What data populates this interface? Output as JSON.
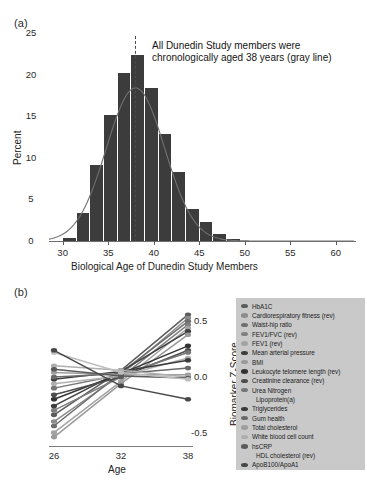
{
  "figure": {
    "panel_a_tag": "(a)",
    "panel_b_tag": "(b)"
  },
  "panel_a": {
    "annotation_line1": "All Dunedin Study members were",
    "annotation_line2": "chronologically aged 38 years (gray line)",
    "annotation": "All Dunedin Study members were\nchronologically aged 38 years (gray line)",
    "ylabel": "Percent",
    "xlabel": "Biological Age of Dunedin Study Members",
    "xticks": [
      "30",
      "35",
      "40",
      "45",
      "50",
      "55",
      "60"
    ],
    "yticks": [
      "0",
      "5",
      "10",
      "15",
      "20",
      "25"
    ],
    "reference_line_age": "38",
    "bar_color": "#3c3c3c",
    "curve_color": "#707070",
    "dash_color": "#4a4a4a"
  },
  "panel_b": {
    "ylabel": "Biomarker Z-Score",
    "xlabel": "Age",
    "xticks": [
      "26",
      "32",
      "38"
    ],
    "yticks": [
      "0.5",
      "0.0",
      "-0.5"
    ],
    "legend_background": "#c9c9c9",
    "legend_title": "",
    "legend": [
      {
        "label": "HbA1C",
        "color": "#5c5c5c",
        "indent": false
      },
      {
        "label": "Cardiorespiratory fitness (rev)",
        "color": "#8c8c8c",
        "indent": false
      },
      {
        "label": "Waist-hip ratio",
        "color": "#6e6e6e",
        "indent": false
      },
      {
        "label": "FEV1/FVC (rev)",
        "color": "#7f7f7f",
        "indent": false
      },
      {
        "label": "FEV1 (rev)",
        "color": "#a3a3a3",
        "indent": false
      },
      {
        "label": "Mean arterial pressure",
        "color": "#3f3f3f",
        "indent": false
      },
      {
        "label": "BMI",
        "color": "#9a9a9a",
        "indent": false
      },
      {
        "label": "Leukocyte telomere length (rev)",
        "color": "#333333",
        "indent": false
      },
      {
        "label": "Creatinine clearance (rev)",
        "color": "#4d4d4d",
        "indent": false
      },
      {
        "label": "Urea Nitrogen",
        "color": "#777777",
        "indent": false
      },
      {
        "label": "Lipoprotein(a)",
        "color": "#b0b0b0",
        "indent": true
      },
      {
        "label": "Triglycerides",
        "color": "#3a3a3a",
        "indent": false
      },
      {
        "label": "Gum health",
        "color": "#6a6a6a",
        "indent": false
      },
      {
        "label": "Total cholesterol",
        "color": "#9e9e9e",
        "indent": false
      },
      {
        "label": "White blood cell count",
        "color": "#aeaeae",
        "indent": false
      },
      {
        "label": "hsCRP",
        "color": "#5a5a5a",
        "indent": false
      },
      {
        "label": "HDL cholesterol (rev)",
        "color": "#bdbdbd",
        "indent": true
      },
      {
        "label": "ApoB100/ApoA1",
        "color": "#484848",
        "indent": false
      }
    ]
  },
  "chart_data": [
    {
      "type": "bar",
      "title": "Distribution of Biological Age of Dunedin Study Members",
      "xlabel": "Biological Age of Dunedin Study Members",
      "ylabel": "Percent",
      "xlim": [
        28.5,
        62.0
      ],
      "ylim": [
        0,
        25
      ],
      "xticks": [
        30,
        35,
        40,
        45,
        50,
        55,
        60
      ],
      "yticks": [
        0,
        5,
        10,
        15,
        20,
        25
      ],
      "grid": false,
      "bin_width": 1.5,
      "bin_centers": [
        30.8,
        32.3,
        33.8,
        35.3,
        36.8,
        38.3,
        39.8,
        41.3,
        42.8,
        44.3,
        45.8,
        47.3,
        48.8
      ],
      "values": [
        0.4,
        3.4,
        9.1,
        15.2,
        20.2,
        22.3,
        18.4,
        12.9,
        8.3,
        3.8,
        2.3,
        0.8,
        0.2
      ],
      "overlay": {
        "type": "line",
        "name": "normal density fit",
        "mean": 38.0,
        "sd": 3.2,
        "peak_percent": 18.4
      },
      "annotations": [
        {
          "text": "All Dunedin Study members were chronologically aged 38 years (gray line)",
          "x": 43.0,
          "y": 24.0
        },
        {
          "type": "vline",
          "x": 38,
          "style": "dashed",
          "label": "chronological age 38"
        }
      ]
    },
    {
      "type": "line",
      "title": "Biomarker Z-Scores across Ages 26, 32, 38",
      "xlabel": "Age",
      "ylabel": "Biomarker Z-Score",
      "x": [
        26,
        32,
        38
      ],
      "xticks": [
        26,
        32,
        38
      ],
      "yticks": [
        -0.5,
        0.0,
        0.5
      ],
      "ylim": [
        -0.62,
        0.62
      ],
      "grid": false,
      "legend_position": "right",
      "series": [
        {
          "name": "HbA1C",
          "values": [
            -0.34,
            0.06,
            0.56
          ]
        },
        {
          "name": "Cardiorespiratory fitness (rev)",
          "values": [
            -0.4,
            0.02,
            0.53
          ]
        },
        {
          "name": "Waist-hip ratio",
          "values": [
            -0.44,
            0.04,
            0.5
          ]
        },
        {
          "name": "FEV1/FVC (rev)",
          "values": [
            -0.3,
            0.0,
            0.47
          ]
        },
        {
          "name": "FEV1 (rev)",
          "values": [
            -0.5,
            -0.04,
            0.44
          ]
        },
        {
          "name": "Mean arterial pressure",
          "values": [
            -0.26,
            0.05,
            0.41
          ]
        },
        {
          "name": "BMI",
          "values": [
            -0.54,
            -0.06,
            0.38
          ]
        },
        {
          "name": "Leukocyte telomere length (rev)",
          "values": [
            -0.2,
            0.03,
            0.28
          ]
        },
        {
          "name": "Creatinine clearance (rev)",
          "values": [
            -0.16,
            0.0,
            0.24
          ]
        },
        {
          "name": "Urea Nitrogen",
          "values": [
            -0.1,
            0.02,
            0.22
          ]
        },
        {
          "name": "Lipoprotein(a)",
          "values": [
            -0.06,
            0.01,
            0.17
          ]
        },
        {
          "name": "Triglycerides",
          "values": [
            -0.02,
            0.05,
            0.15
          ]
        },
        {
          "name": "Gum health",
          "values": [
            0.0,
            0.03,
            0.08
          ]
        },
        {
          "name": "Total cholesterol",
          "values": [
            0.04,
            0.02,
            0.02
          ]
        },
        {
          "name": "White blood cell count",
          "values": [
            0.1,
            0.06,
            0.0
          ]
        },
        {
          "name": "hsCRP",
          "values": [
            0.07,
            0.01,
            -0.01
          ]
        },
        {
          "name": "HDL cholesterol (rev)",
          "values": [
            0.22,
            0.04,
            -0.02
          ]
        },
        {
          "name": "ApoB100/ApoA1",
          "values": [
            0.24,
            -0.08,
            -0.2
          ]
        }
      ]
    }
  ]
}
